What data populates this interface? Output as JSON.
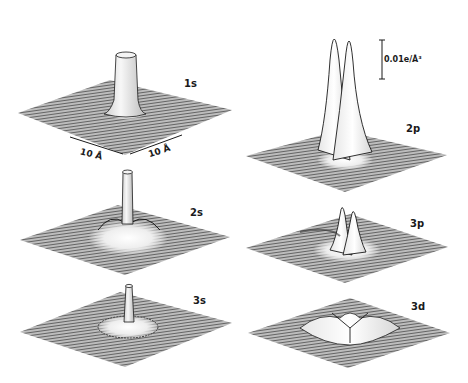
{
  "figure": {
    "panels": [
      {
        "id": "1s",
        "label": "1s"
      },
      {
        "id": "2s",
        "label": "2s"
      },
      {
        "id": "3s",
        "label": "3s"
      },
      {
        "id": "2p",
        "label": "2p"
      },
      {
        "id": "3p",
        "label": "3p"
      },
      {
        "id": "3d",
        "label": "3d"
      }
    ],
    "scale_bar": {
      "label": "0.01e/Å³"
    },
    "dimensions": {
      "x_label": "10 Å",
      "y_label": "10 Å"
    },
    "colors": {
      "ink": "#1a1a1a",
      "mesh": "#555555",
      "background": "#ffffff"
    }
  }
}
